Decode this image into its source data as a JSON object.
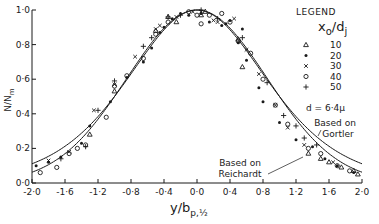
{
  "chart_data": {
    "type": "scatter",
    "title": "",
    "xlabel": "y/b",
    "xlabel_subscript": "p,½",
    "ylabel": "N/N",
    "ylabel_subscript": "m",
    "xlim": [
      -2.0,
      2.0
    ],
    "ylim": [
      0.0,
      1.0
    ],
    "grid": false,
    "x_ticks": [
      -2.0,
      -1.6,
      -1.2,
      -0.8,
      -0.4,
      0.0,
      0.4,
      0.8,
      1.2,
      1.6,
      2.0
    ],
    "x_tick_labels": [
      "-2·0",
      "-1·6",
      "-1·2",
      "-0·8",
      "-0·4",
      "0·0",
      "0·4",
      "0·8",
      "1·2",
      "1·6",
      "2·0"
    ],
    "y_ticks": [
      0.0,
      0.2,
      0.4,
      0.6,
      0.8,
      1.0
    ],
    "y_tick_labels": [
      "0·0",
      "0·2",
      "0·4",
      "0·6",
      "0·8",
      "1·0"
    ],
    "legend": {
      "placement": "top-right",
      "title": "LEGEND",
      "variable": "x",
      "variable_sub": "o",
      "variable_denom": "d",
      "variable_denom_sub": "j",
      "note": "d = 6·4μ"
    },
    "series": [
      {
        "name": "10",
        "marker": "triangle",
        "points": [
          [
            -1.3,
            0.28
          ],
          [
            -1.0,
            0.53
          ],
          [
            -0.5,
            0.88
          ],
          [
            -0.25,
            0.93
          ],
          [
            -0.35,
            0.96
          ],
          [
            0.05,
            0.97
          ],
          [
            0.1,
            0.99
          ],
          [
            0.5,
            0.83
          ],
          [
            0.55,
            0.67
          ],
          [
            1.35,
            0.17
          ],
          [
            1.5,
            0.14
          ],
          [
            1.6,
            0.12
          ],
          [
            1.75,
            0.09
          ],
          [
            1.9,
            0.07
          ],
          [
            1.95,
            0.05
          ]
        ]
      },
      {
        "name": "20",
        "marker": "dot",
        "points": [
          [
            -1.95,
            0.1
          ],
          [
            -1.8,
            0.12
          ],
          [
            -1.65,
            0.15
          ],
          [
            -1.4,
            0.23
          ],
          [
            -1.3,
            0.33
          ],
          [
            -1.05,
            0.47
          ],
          [
            -0.85,
            0.61
          ],
          [
            -0.65,
            0.7
          ],
          [
            -0.55,
            0.78
          ],
          [
            -0.45,
            0.87
          ],
          [
            -0.4,
            0.9
          ],
          [
            -0.3,
            0.95
          ],
          [
            -0.2,
            0.98
          ],
          [
            -0.1,
            0.97
          ],
          [
            0.05,
            0.98
          ],
          [
            0.15,
            0.93
          ],
          [
            0.3,
            0.91
          ],
          [
            0.35,
            0.92
          ],
          [
            0.4,
            0.94
          ],
          [
            0.55,
            0.89
          ],
          [
            0.5,
            0.81
          ],
          [
            0.6,
            0.71
          ],
          [
            0.75,
            0.55
          ],
          [
            0.8,
            0.47
          ],
          [
            1.0,
            0.35
          ],
          [
            1.2,
            0.25
          ],
          [
            1.4,
            0.21
          ],
          [
            1.55,
            0.14
          ],
          [
            1.7,
            0.1
          ],
          [
            1.9,
            0.06
          ]
        ]
      },
      {
        "name": "30",
        "marker": "x",
        "points": [
          [
            -1.8,
            0.13
          ],
          [
            -1.55,
            0.18
          ],
          [
            -1.25,
            0.42
          ],
          [
            -1.0,
            0.57
          ],
          [
            -0.75,
            0.73
          ],
          [
            -0.5,
            0.89
          ],
          [
            -0.45,
            0.91
          ],
          [
            -0.25,
            0.96
          ],
          [
            -0.05,
            0.99
          ],
          [
            0.05,
            0.99
          ],
          [
            0.2,
            0.94
          ],
          [
            0.25,
            0.93
          ],
          [
            0.45,
            0.95
          ],
          [
            0.6,
            0.77
          ],
          [
            0.75,
            0.63
          ],
          [
            0.95,
            0.45
          ],
          [
            1.1,
            0.32
          ],
          [
            1.3,
            0.22
          ],
          [
            1.65,
            0.12
          ]
        ]
      },
      {
        "name": "40",
        "marker": "circle",
        "points": [
          [
            -1.9,
            0.06
          ],
          [
            -1.7,
            0.09
          ],
          [
            -1.55,
            0.17
          ],
          [
            -1.45,
            0.2
          ],
          [
            -1.35,
            0.22
          ],
          [
            -1.1,
            0.38
          ],
          [
            -1.0,
            0.56
          ],
          [
            -0.85,
            0.62
          ],
          [
            -0.65,
            0.72
          ],
          [
            -0.5,
            0.86
          ],
          [
            -0.35,
            0.93
          ],
          [
            -0.1,
            0.99
          ],
          [
            0.0,
            0.97
          ],
          [
            0.05,
            0.92
          ],
          [
            0.15,
            0.97
          ],
          [
            0.3,
            0.98
          ],
          [
            0.4,
            0.93
          ],
          [
            0.5,
            0.82
          ],
          [
            0.65,
            0.75
          ],
          [
            0.8,
            0.6
          ],
          [
            0.95,
            0.45
          ],
          [
            1.1,
            0.34
          ],
          [
            1.35,
            0.2
          ],
          [
            1.5,
            0.17
          ],
          [
            1.7,
            0.1
          ],
          [
            1.85,
            0.07
          ]
        ]
      },
      {
        "name": "50",
        "marker": "plus",
        "points": [
          [
            -1.65,
            0.14
          ],
          [
            -1.35,
            0.21
          ],
          [
            -1.2,
            0.42
          ],
          [
            -1.0,
            0.59
          ],
          [
            -0.65,
            0.79
          ],
          [
            -0.55,
            0.84
          ],
          [
            -0.35,
            0.96
          ],
          [
            -0.2,
            0.97
          ],
          [
            0.05,
            1.0
          ],
          [
            0.25,
            0.95
          ],
          [
            0.55,
            0.84
          ],
          [
            0.85,
            0.58
          ],
          [
            1.05,
            0.39
          ],
          [
            1.2,
            0.33
          ],
          [
            1.3,
            0.26
          ],
          [
            1.45,
            0.22
          ]
        ]
      }
    ],
    "curves": [
      {
        "name": "Based on Gortler",
        "label_lines": [
          "Based on",
          "Gortler"
        ],
        "model": "sech2",
        "k": 0.8814
      },
      {
        "name": "Based on Reichardt",
        "label_lines": [
          "Based on",
          "Reichardt"
        ],
        "model": "gaussian",
        "k": 0.6931
      }
    ]
  }
}
